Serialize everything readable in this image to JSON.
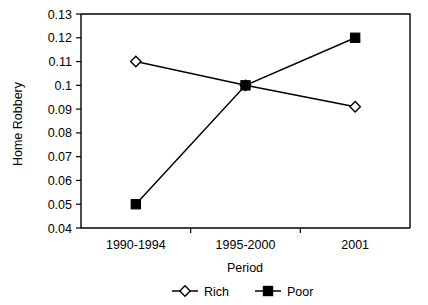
{
  "chart_data": {
    "type": "line",
    "title": "",
    "xlabel": "Period",
    "ylabel": "Home Robbery",
    "categories": [
      "1990-1994",
      "1995-2000",
      "2001"
    ],
    "series": [
      {
        "name": "Rich",
        "marker": "open-diamond",
        "values": [
          0.11,
          0.1,
          0.091
        ]
      },
      {
        "name": "Poor",
        "marker": "filled-square",
        "values": [
          0.05,
          0.1,
          0.12
        ]
      }
    ],
    "ylim": [
      0.04,
      0.13
    ],
    "ytick_labels": [
      "0.13",
      "0.12",
      "0.11",
      "0.1",
      "0.09",
      "0.08",
      "0.07",
      "0.06",
      "0.05",
      "0.04"
    ],
    "ytick_values": [
      0.13,
      0.12,
      0.11,
      0.1,
      0.09,
      0.08,
      0.07,
      0.06,
      0.05,
      0.04
    ],
    "grid": false,
    "legend_position": "bottom",
    "colors": {
      "axis": "#000000",
      "series_rich": "#000000",
      "series_poor": "#000000",
      "background": "#ffffff"
    }
  }
}
